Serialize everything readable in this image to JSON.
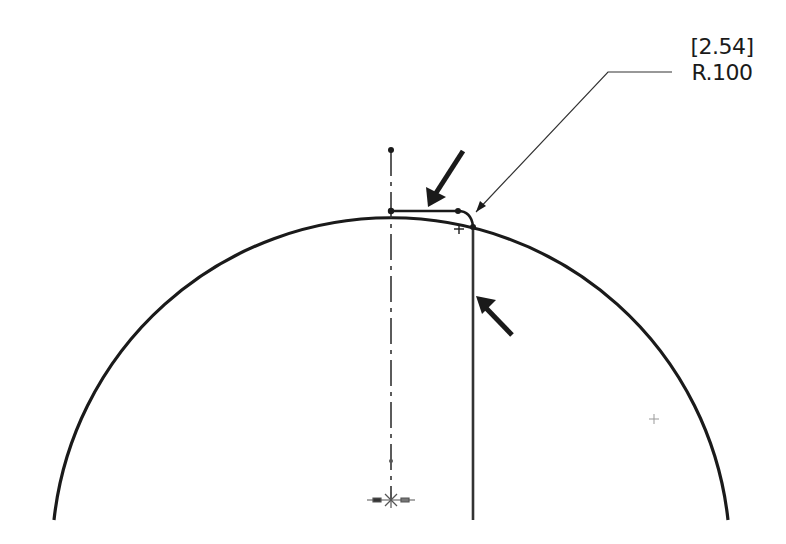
{
  "drawing": {
    "type": "CAD sketch",
    "background": "#ffffff",
    "stroke_color": "#1a1a1a"
  },
  "dimension": {
    "alternate_value": "[2.54]",
    "primary_value": "R.100",
    "label": "fillet radius dimension"
  },
  "geometry": {
    "outer_arc": {
      "center": [
        392,
        489
      ],
      "radius": 339,
      "start": [
        54,
        520
      ],
      "end": [
        728,
        520
      ]
    },
    "centerline": {
      "x": 391,
      "y_top": 150,
      "y_bottom": 502
    },
    "horizontal_edge": {
      "x1": 391,
      "x2": 458,
      "y": 211
    },
    "fillet": {
      "from": [
        458,
        211
      ],
      "to": [
        473,
        226
      ]
    },
    "vertical_edge": {
      "x": 473,
      "y1": 226,
      "y2": 520
    },
    "leader": {
      "points": [
        [
          476,
          212
        ],
        [
          608,
          72
        ],
        [
          672,
          72
        ]
      ]
    },
    "arrows": [
      {
        "name": "pointer-arrow-top",
        "from": [
          463,
          151
        ],
        "to": [
          428,
          205
        ]
      },
      {
        "name": "pointer-arrow-side",
        "from": [
          512,
          335
        ],
        "to": [
          476,
          297
        ]
      }
    ],
    "markers": [
      {
        "name": "fillet-center-mark",
        "x": 459,
        "y": 229
      },
      {
        "name": "arc-center-mark",
        "x": 654,
        "y": 419
      },
      {
        "name": "origin-mark",
        "x": 391,
        "y": 500
      }
    ]
  }
}
